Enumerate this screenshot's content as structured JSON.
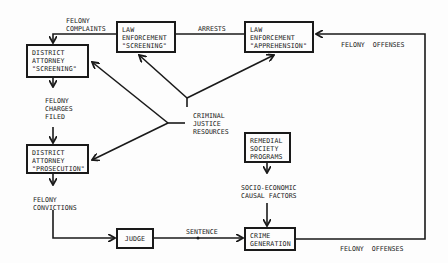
{
  "diagram": {
    "nodes": {
      "da_screening": {
        "lines": [
          "DISTRICT",
          "ATTORNEY",
          "\"SCREENING\""
        ]
      },
      "le_screening": {
        "lines": [
          "LAW",
          "ENFORCEMENT",
          "\"SCREENING\""
        ]
      },
      "le_apprehension": {
        "lines": [
          "LAW",
          "ENFORCEMENT",
          "\"APPREHENSION\""
        ]
      },
      "da_prosecution": {
        "lines": [
          "DISTRICT",
          "ATTORNEY",
          "\"PROSECUTION\""
        ]
      },
      "judge": {
        "lines": [
          "JUDGE"
        ]
      },
      "crime_generation": {
        "lines": [
          "CRIME",
          "GENERATION"
        ]
      },
      "remedial_programs": {
        "lines": [
          "REMEDIAL",
          "SOCIETY",
          "PROGRAMS"
        ]
      }
    },
    "labels": {
      "felony_complaints": [
        "FELONY",
        "COMPLAINTS"
      ],
      "arrests": [
        "ARRESTS"
      ],
      "felony_offenses_top": [
        "FELONY  OFFENSES"
      ],
      "felony_charges_filed": [
        "FELONY",
        "CHARGES",
        "FILED"
      ],
      "criminal_justice_resources": [
        "CRIMINAL",
        "JUSTICE",
        "RESOURCES"
      ],
      "felony_convictions": [
        "FELONY",
        "CONVICTIONS"
      ],
      "socio_economic": [
        "SOCIO-ECONOMIC",
        "CAUSAL FACTORS"
      ],
      "sentence": [
        "SENTENCE"
      ],
      "felony_offenses_bottom": [
        "FELONY  OFFENSES"
      ]
    },
    "edges": [
      {
        "from": "crime_generation",
        "to": "le_apprehension",
        "label": "FELONY OFFENSES"
      },
      {
        "from": "le_apprehension",
        "to": "le_screening",
        "label": "ARRESTS"
      },
      {
        "from": "le_screening",
        "to": "da_screening",
        "label": "FELONY COMPLAINTS"
      },
      {
        "from": "da_screening",
        "to": "da_prosecution",
        "label": "FELONY CHARGES FILED"
      },
      {
        "from": "da_prosecution",
        "to": "judge",
        "label": "FELONY CONVICTIONS"
      },
      {
        "from": "judge",
        "to": "crime_generation",
        "label": "SENTENCE"
      },
      {
        "from": "remedial_programs",
        "to": "crime_generation",
        "label": "SOCIO-ECONOMIC CAUSAL FACTORS"
      },
      {
        "from": "criminal_justice_resources",
        "to": "le_screening",
        "label": ""
      },
      {
        "from": "criminal_justice_resources",
        "to": "le_apprehension",
        "label": ""
      },
      {
        "from": "criminal_justice_resources",
        "to": "da_screening",
        "label": ""
      },
      {
        "from": "criminal_justice_resources",
        "to": "da_prosecution",
        "label": ""
      }
    ],
    "colors": {
      "ink": "#1a1a1a",
      "paper": "#fdfdfd"
    }
  }
}
